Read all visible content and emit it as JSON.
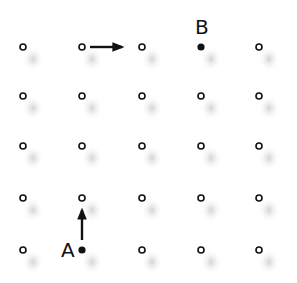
{
  "diagram": {
    "type": "lattice-grid",
    "rows": 5,
    "cols": 5,
    "col_x": [
      23,
      82,
      142,
      201,
      259
    ],
    "row_y": [
      47,
      96,
      146,
      198,
      250
    ],
    "point_style": "hollow-circle",
    "colors": {
      "stroke": "#111111",
      "shadow": "#cccccc",
      "background": "#ffffff"
    },
    "labeled_points": [
      {
        "label": "A",
        "row": 4,
        "col": 1,
        "filled": true
      },
      {
        "label": "B",
        "row": 0,
        "col": 3,
        "filled": true
      }
    ],
    "arrows": [
      {
        "name": "right-arrow",
        "from_row": 0,
        "from_col": 1,
        "direction": "right"
      },
      {
        "name": "up-arrow",
        "from_row": 4,
        "from_col": 1,
        "direction": "up"
      }
    ]
  },
  "labels": {
    "a": "A",
    "b": "B"
  }
}
